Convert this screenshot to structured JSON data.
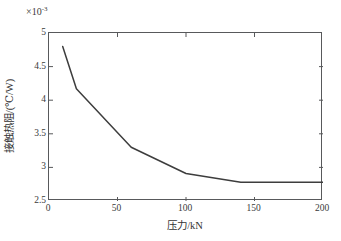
{
  "chart_data": {
    "type": "line",
    "title": "",
    "subtitle": "",
    "xlabel": "压力/kN",
    "ylabel": "接触热阻/(℃/W)",
    "y_multiplier_label": "×10",
    "y_multiplier_exponent": "-3",
    "xlim": [
      0,
      200
    ],
    "ylim": [
      2.5,
      5
    ],
    "xticks": [
      "0",
      "50",
      "100",
      "150",
      "200"
    ],
    "xtick_values": [
      0,
      50,
      100,
      150,
      200
    ],
    "yticks": [
      "2.5",
      "3",
      "3.5",
      "4",
      "4.5",
      "5"
    ],
    "ytick_values": [
      2.5,
      3,
      3.5,
      4,
      4.5,
      5
    ],
    "grid": false,
    "legend": null,
    "series": [
      {
        "name": "接触热阻",
        "color": "#3d3d3d",
        "x": [
          10,
          20,
          60,
          100,
          140,
          200
        ],
        "y": [
          4.8,
          4.17,
          3.3,
          2.91,
          2.78,
          2.78
        ],
        "y_units": "10^-3 ℃/W"
      }
    ],
    "annotations": []
  }
}
